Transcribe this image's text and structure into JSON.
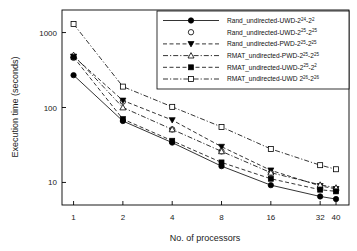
{
  "chart_data": {
    "type": "line",
    "title": "",
    "xlabel": "No. of processors",
    "ylabel": "Execution time (seconds)",
    "xscale": "log",
    "yscale": "log",
    "xticks": [
      1,
      2,
      4,
      8,
      16,
      32,
      40
    ],
    "xtick_labels": [
      "1",
      "2",
      "4",
      "8",
      "16",
      "32",
      "40"
    ],
    "yticks": [
      10,
      100,
      1000
    ],
    "ytick_labels": [
      "10",
      "100",
      "1000"
    ],
    "xlim": [
      0.85,
      48
    ],
    "ylim": [
      5,
      2000
    ],
    "grid": false,
    "legend_position": "top-right",
    "x": [
      1,
      2,
      4,
      8,
      16,
      32,
      40
    ],
    "series": [
      {
        "name": "Rand_undirected-UWD-2",
        "exp1": "24",
        "mid": "-2",
        "exp2": "2",
        "label_full": "Rand_undirected-UWD-2^24-2^2",
        "marker": "filled-circle",
        "linestyle": "solid",
        "values": [
          270,
          66,
          34,
          16.5,
          9.2,
          6.5,
          6.0
        ]
      },
      {
        "name": "Rand_undirected-UWD-2",
        "exp1": "25",
        "mid": "-2",
        "exp2": "25",
        "label_full": "Rand_undirected-UWD-2^25-2^25",
        "marker": "open-circle",
        "linestyle": "none",
        "values": [
          460,
          120,
          51,
          26,
          13.5,
          8.3,
          7.8
        ]
      },
      {
        "name": "Rand_undirected-PWD-2",
        "exp1": "25",
        "mid": "-2",
        "exp2": "25",
        "label_full": "Rand_undirected-PWD-2^25-2^25",
        "marker": "filled-triangle-down",
        "linestyle": "dashed",
        "values": [
          480,
          124,
          68,
          30,
          14.5,
          9.0,
          8.2
        ]
      },
      {
        "name": "RMAT_undirected-PWD-2",
        "exp1": "25",
        "mid": "-2",
        "exp2": "25",
        "label_full": "RMAT_undirected-PWD-2^25-2^25",
        "marker": "open-triangle-up",
        "linestyle": "dashdot",
        "values": [
          500,
          100,
          51,
          26,
          13.5,
          9.3,
          8.5
        ]
      },
      {
        "name": "RMAT_undirected-UWD-2",
        "exp1": "25",
        "mid": "-2",
        "exp2": "2",
        "label_full": "RMAT_undirected-UWD-2^25-2^2",
        "marker": "filled-square",
        "linestyle": "dashed",
        "values": [
          470,
          70,
          36,
          18.5,
          11.2,
          8.0,
          7.6
        ]
      },
      {
        "name": "RMAT_undirected-UWD 2",
        "exp1": "26",
        "mid": "-2",
        "exp2": "26",
        "label_full": "RMAT_undirected-UWD 2^26-2^26",
        "marker": "open-square",
        "linestyle": "dashdot",
        "values": [
          1300,
          190,
          102,
          55,
          28,
          17,
          15
        ]
      }
    ]
  }
}
